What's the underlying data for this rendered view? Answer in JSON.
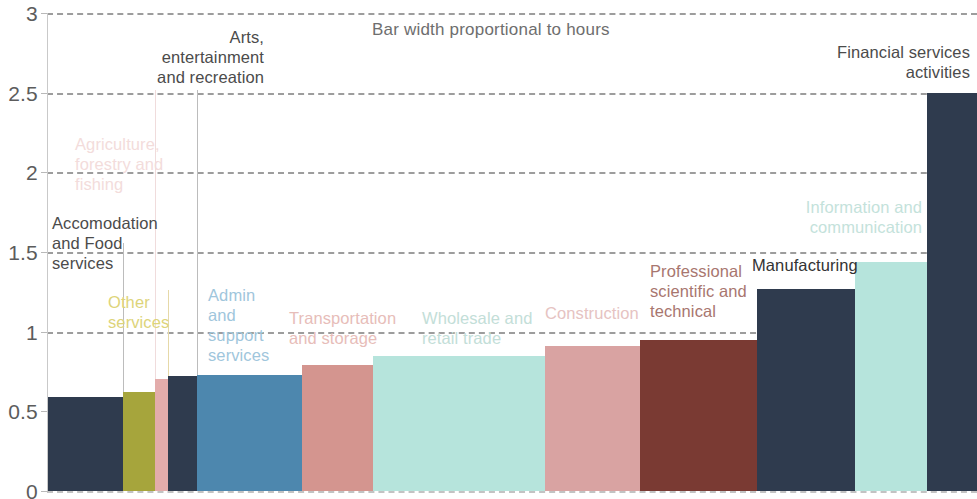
{
  "chart_data": {
    "type": "bar",
    "title": "Bar width proportional to hours",
    "xlabel": "",
    "ylabel": "",
    "ylim": [
      0,
      3
    ],
    "yticks": [
      "0",
      "0.5",
      "1",
      "1.5",
      "2",
      "2.5",
      "3"
    ],
    "ytick_values": [
      0,
      0.5,
      1,
      1.5,
      2,
      2.5,
      3
    ],
    "grid": true,
    "legend": "none",
    "note": "Bar width proportional to hours; bars sorted ascending by value",
    "categories": [
      "Accomodation and Food services",
      "Other services",
      "Agriculture, forestry and fishing",
      "Arts, entertainment and recreation",
      "Admin and support services",
      "Transportation and storage",
      "Wholesale and retail trade",
      "Construction",
      "Professional scientific and technical",
      "Manufacturing",
      "Information and communication",
      "Financial services activities"
    ],
    "values": [
      0.59,
      0.62,
      0.7,
      0.72,
      0.73,
      0.79,
      0.85,
      0.91,
      0.95,
      1.27,
      1.44,
      2.5
    ],
    "widths": [
      75,
      32,
      13,
      29,
      105,
      71,
      172,
      95,
      117,
      98,
      72,
      50
    ],
    "colors": [
      "#2f3b4e",
      "#a6a53c",
      "#e3acab",
      "#2f3b4e",
      "#4d87ae",
      "#d4958f",
      "#b6e4dc",
      "#d9a3a2",
      "#7a3a33",
      "#2f3b4e",
      "#b6e4dc",
      "#2f3b4e"
    ],
    "bars": [
      {
        "label": "Accomodation\nand Food\nservices",
        "value": 0.59,
        "color": "#2f3b4e",
        "label_color": "#4b4b4b",
        "x": 48,
        "width": 75
      },
      {
        "label": "Other\nservices",
        "value": 0.62,
        "color": "#a6a53c",
        "label_color": "#ddd47a",
        "x": 123,
        "width": 32
      },
      {
        "label": "Agriculture,\nforestry and\nfishing",
        "value": 0.7,
        "color": "#e3acab",
        "label_color": "#f3dcdb",
        "x": 155,
        "width": 13
      },
      {
        "label": "Arts,\nentertainment\nand recreation",
        "value": 0.72,
        "color": "#2f3b4e",
        "label_color": "#4b4b4b",
        "x": 168,
        "width": 29
      },
      {
        "label": "Admin\nand\nsupport\nservices",
        "value": 0.73,
        "color": "#4d87ae",
        "label_color": "#9fc6dc",
        "x": 197,
        "width": 105
      },
      {
        "label": "Transportation\nand storage",
        "value": 0.79,
        "color": "#d4958f",
        "label_color": "#e7bdb9",
        "x": 302,
        "width": 71
      },
      {
        "label": "Wholesale and\nretail trade",
        "value": 0.85,
        "color": "#b6e4dc",
        "label_color": "#c3ded8",
        "x": 373,
        "width": 172
      },
      {
        "label": "Construction",
        "value": 0.91,
        "color": "#d9a3a2",
        "label_color": "#e6c3c2",
        "x": 545,
        "width": 95
      },
      {
        "label": "Professional\nscientific and\ntechnical",
        "value": 0.95,
        "color": "#7a3a33",
        "label_color": "#a8766f",
        "x": 640,
        "width": 117
      },
      {
        "label": "Manufacturing",
        "value": 1.27,
        "color": "#2f3b4e",
        "label_color": "#333333",
        "x": 757,
        "width": 98
      },
      {
        "label": "Information and\ncommunication",
        "value": 1.44,
        "color": "#b6e4dc",
        "label_color": "#c4e2db",
        "x": 855,
        "width": 72
      },
      {
        "label": "Financial services\nactivities",
        "value": 2.5,
        "color": "#2f3b4e",
        "label_color": "#4b4b4b",
        "x": 927,
        "width": 50
      }
    ]
  }
}
